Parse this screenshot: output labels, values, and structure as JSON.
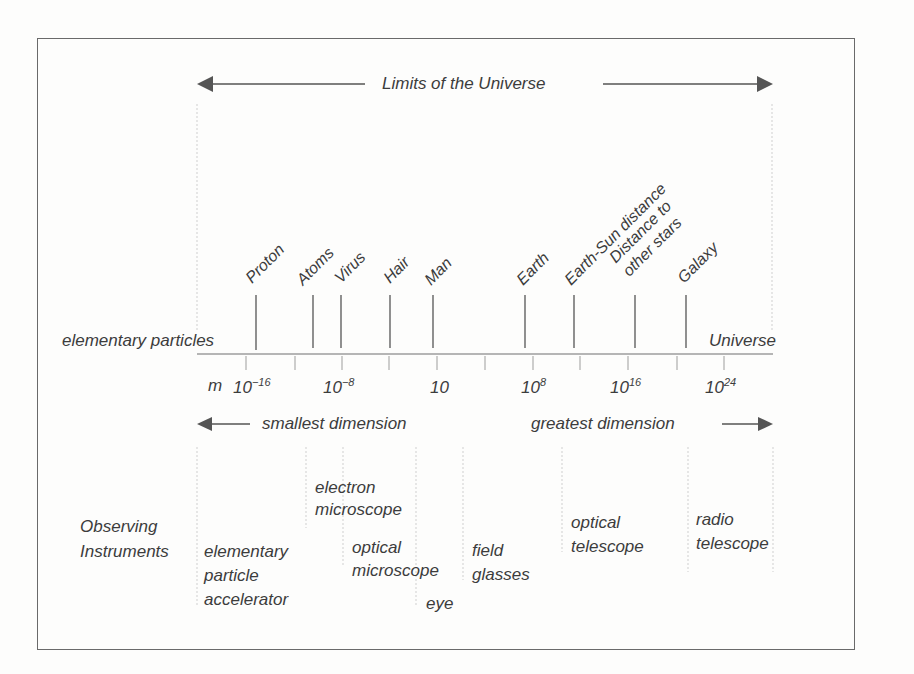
{
  "title": "Limits of the Universe",
  "left_extreme_label": "elementary particles",
  "right_extreme_label": "Universe",
  "markers": [
    {
      "label": "Proton",
      "x": 256
    },
    {
      "label": "Atoms",
      "x": 313
    },
    {
      "label": "Virus",
      "x": 341
    },
    {
      "label": "Hair",
      "x": 390
    },
    {
      "label": "Man",
      "x": 433
    },
    {
      "label": "Earth",
      "x": 525
    },
    {
      "label": "Earth-Sun distance",
      "x": 574
    },
    {
      "label": "Distance to\nother stars",
      "x": 635
    },
    {
      "label": "Galaxy",
      "x": 686
    }
  ],
  "scale": {
    "unit": "m",
    "ticks": [
      {
        "base": "10",
        "exp": "−16"
      },
      {
        "base": "10",
        "exp": "−8"
      },
      {
        "base": "10",
        "exp": ""
      },
      {
        "base": "10",
        "exp": "8"
      },
      {
        "base": "10",
        "exp": "16"
      },
      {
        "base": "10",
        "exp": "24"
      }
    ]
  },
  "smallest_label": "smallest dimension",
  "greatest_label": "greatest dimension",
  "instruments": {
    "heading": "Observing\nInstruments",
    "items": [
      {
        "label": "elementary\nparticle\naccelerator"
      },
      {
        "label": "electron\nmicroscope"
      },
      {
        "label": "optical\nmicroscope"
      },
      {
        "label": "eye"
      },
      {
        "label": "field\nglasses"
      },
      {
        "label": "optical\ntelescope"
      },
      {
        "label": "radio\ntelescope"
      }
    ]
  },
  "colors": {
    "ink": "#3c3c3c",
    "guide": "#c8c8c8",
    "frame": "#6a6a6a"
  }
}
